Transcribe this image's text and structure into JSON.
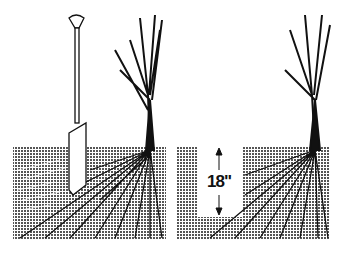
{
  "figure": {
    "panels": [
      {
        "id": "left",
        "description": "Spade inserted into soil beside bare-root tree"
      },
      {
        "id": "right",
        "description": "Trench dug beside tree with depth marker"
      }
    ],
    "depth_label": "18\"",
    "colors": {
      "ink": "#111111",
      "soil": "#8a8a8a",
      "background": "#ffffff"
    }
  }
}
